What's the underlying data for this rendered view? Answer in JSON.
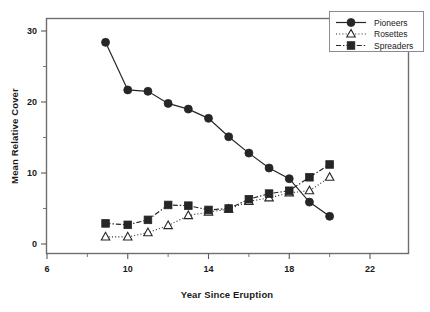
{
  "chart_data": {
    "type": "line",
    "title": "",
    "xlabel": "Year Since Eruption",
    "ylabel": "Mean Relative Cover",
    "xlim": [
      6,
      23.8
    ],
    "ylim": [
      -1.5,
      33
    ],
    "xticks": [
      6,
      10,
      14,
      18,
      22
    ],
    "yticks": [
      0,
      10,
      20,
      30
    ],
    "xtick_labels": [
      "6",
      "10",
      "14",
      "18",
      "22"
    ],
    "ytick_labels": [
      "0",
      "10",
      "20",
      "30"
    ],
    "grid": false,
    "legend_position": "top-right",
    "series": [
      {
        "name": "Pioneers",
        "marker": "filled-circle",
        "linestyle": "solid",
        "color": "#262626",
        "x": [
          8.9,
          10,
          11,
          12,
          13,
          14,
          15,
          16,
          17,
          18,
          19,
          20
        ],
        "y": [
          28.4,
          21.7,
          21.5,
          19.8,
          19.0,
          17.7,
          15.1,
          12.8,
          10.7,
          9.2,
          5.9,
          3.9
        ]
      },
      {
        "name": "Rosettes",
        "marker": "open-triangle",
        "linestyle": "dotted",
        "color": "#262626",
        "x": [
          8.9,
          10,
          11,
          12,
          13,
          14,
          15,
          16,
          17,
          18,
          19,
          20
        ],
        "y": [
          1.0,
          1.0,
          1.6,
          2.6,
          4.0,
          4.5,
          4.9,
          6.0,
          6.5,
          7.2,
          7.5,
          9.4
        ]
      },
      {
        "name": "Spreaders",
        "marker": "filled-square",
        "linestyle": "dashdot",
        "color": "#262626",
        "x": [
          8.9,
          10,
          11,
          12,
          13,
          14,
          15,
          16,
          17,
          18,
          19,
          20
        ],
        "y": [
          2.9,
          2.7,
          3.4,
          5.5,
          5.4,
          4.8,
          5.0,
          6.3,
          7.1,
          7.5,
          9.4,
          11.2
        ]
      }
    ]
  },
  "axes": {
    "xlabel": "Year Since Eruption",
    "ylabel": "Mean Relative Cover"
  },
  "legend": {
    "entries": [
      {
        "label": "Pioneers"
      },
      {
        "label": "Rosettes"
      },
      {
        "label": "Spreaders"
      }
    ]
  },
  "ticks": {
    "x": [
      "6",
      "10",
      "14",
      "18",
      "22"
    ],
    "y": [
      "0",
      "10",
      "20",
      "30"
    ]
  },
  "colors": {
    "ink": "#262626",
    "frame": "#6e6e6e",
    "background": "#ffffff"
  }
}
